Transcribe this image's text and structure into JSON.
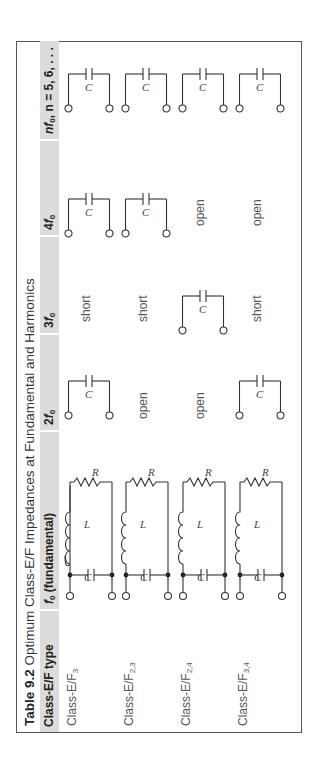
{
  "table": {
    "number": "Table 9.2",
    "caption": "Optimum Class-E/F Impedances at Fundamental and Harmonics",
    "columns": [
      {
        "id": "type",
        "label": "Class-E/F type"
      },
      {
        "id": "f0",
        "label_symbol": "f",
        "label_sub": "0",
        "label_rest": " (fundamental)"
      },
      {
        "id": "2f0",
        "label_prefix": "2",
        "label_symbol": "f",
        "label_sub": "0"
      },
      {
        "id": "3f0",
        "label_prefix": "3",
        "label_symbol": "f",
        "label_sub": "0"
      },
      {
        "id": "4f0",
        "label_prefix": "4",
        "label_symbol": "f",
        "label_sub": "0"
      },
      {
        "id": "nf0",
        "label_prefix": "n",
        "label_symbol": "f",
        "label_sub": "0",
        "label_rest": ", n = 5, 6, . . ."
      }
    ],
    "rows": [
      {
        "type_base": "Class-E/F",
        "type_sub": "3",
        "f0": "parallel-RLC-circuit",
        "2f0": "series-C",
        "3f0": "short",
        "4f0": "series-C",
        "nf0": "series-C"
      },
      {
        "type_base": "Class-E/F",
        "type_sub": "2,3",
        "f0": "parallel-RLC-circuit",
        "2f0": "open",
        "3f0": "short",
        "4f0": "series-C",
        "nf0": "series-C"
      },
      {
        "type_base": "Class-E/F",
        "type_sub": "2,4",
        "f0": "parallel-RLC-circuit",
        "2f0": "open",
        "3f0": "series-C",
        "4f0": "open",
        "nf0": "series-C"
      },
      {
        "type_base": "Class-E/F",
        "type_sub": "3,4",
        "f0": "parallel-RLC-circuit",
        "2f0": "series-C",
        "3f0": "short",
        "4f0": "open",
        "nf0": "series-C"
      }
    ],
    "labels": {
      "open": "open",
      "short": "short",
      "C": "C",
      "L": "L",
      "R": "R"
    }
  }
}
